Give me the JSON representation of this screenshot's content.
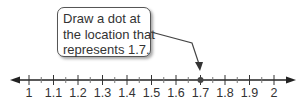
{
  "callout": {
    "lines": [
      "Draw a dot at",
      "the location that",
      "represents 1.7."
    ]
  },
  "number_line": {
    "labels": [
      "1",
      "1.1",
      "1.2",
      "1.3",
      "1.4",
      "1.5",
      "1.6",
      "1.7",
      "1.8",
      "1.9",
      "2"
    ],
    "min": 1,
    "max": 2,
    "major_step": 0.1,
    "minor_step": 0.05,
    "dot_value": 1.7
  },
  "chart_data": {
    "type": "number_line",
    "title": "",
    "annotation": "Draw a dot at the location that represents 1.7.",
    "range": [
      1,
      2
    ],
    "tick_labels": [
      "1",
      "1.1",
      "1.2",
      "1.3",
      "1.4",
      "1.5",
      "1.6",
      "1.7",
      "1.8",
      "1.9",
      "2"
    ],
    "major_ticks": [
      1,
      1.1,
      1.2,
      1.3,
      1.4,
      1.5,
      1.6,
      1.7,
      1.8,
      1.9,
      2
    ],
    "minor_ticks": [
      1.05,
      1.15,
      1.25,
      1.35,
      1.45,
      1.55,
      1.65,
      1.75,
      1.85,
      1.95
    ],
    "points": [
      1.7
    ],
    "arrows_both_ends": true
  }
}
